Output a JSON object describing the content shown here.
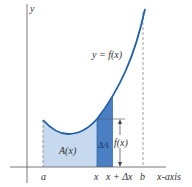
{
  "diagram": {
    "curve_label": "y = f(x)",
    "y_axis_label": "y",
    "x_axis_label": "x-axis",
    "tick_labels": {
      "a": "a",
      "x": "x",
      "x_dx": "x + Δx",
      "b": "b"
    },
    "region_labels": {
      "area": "A(x)",
      "strip": "ΔA",
      "height": "f(x)"
    },
    "colors": {
      "curve": "#1f5fa8",
      "area_fill": "#c6d9ee",
      "strip_fill": "#4a7fc4",
      "axis": "#555555",
      "dashed": "#777777"
    }
  }
}
